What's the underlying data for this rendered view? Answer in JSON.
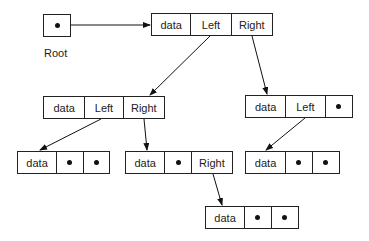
{
  "root": {
    "label": "Root"
  },
  "nodes": [
    {
      "id": "n1",
      "cells": [
        "data",
        "Left",
        "Right"
      ]
    },
    {
      "id": "n2",
      "cells": [
        "data",
        "Left",
        "Right"
      ]
    },
    {
      "id": "n3",
      "cells": [
        "data",
        "Left",
        "•"
      ]
    },
    {
      "id": "n4",
      "cells": [
        "data",
        "•",
        "•"
      ]
    },
    {
      "id": "n5",
      "cells": [
        "data",
        "•",
        "Right"
      ]
    },
    {
      "id": "n6",
      "cells": [
        "data",
        "•",
        "•"
      ]
    },
    {
      "id": "n7",
      "cells": [
        "data",
        "•",
        "•"
      ]
    }
  ],
  "edges": [
    {
      "from": "root",
      "to": "n1"
    },
    {
      "from": "n1.Left",
      "to": "n2"
    },
    {
      "from": "n1.Right",
      "to": "n3"
    },
    {
      "from": "n2.Left",
      "to": "n4"
    },
    {
      "from": "n2.Right",
      "to": "n5"
    },
    {
      "from": "n3.Left",
      "to": "n6"
    },
    {
      "from": "n5.Right",
      "to": "n7"
    }
  ]
}
